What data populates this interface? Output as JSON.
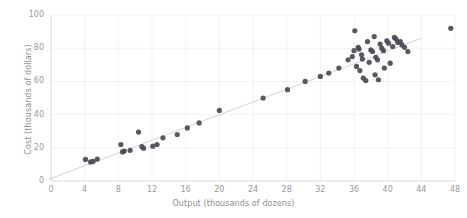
{
  "chart_data": {
    "type": "scatter",
    "title": "",
    "xlabel": "Output (thousands of dozens)",
    "ylabel": "Cost (thousands of dollars)",
    "xlim": [
      0,
      48
    ],
    "ylim": [
      0,
      100
    ],
    "xticks": [
      0,
      4,
      8,
      12,
      16,
      20,
      24,
      28,
      32,
      36,
      40,
      44,
      48
    ],
    "yticks": [
      0,
      20,
      40,
      60,
      80,
      100
    ],
    "grid": true,
    "legend": null,
    "marker_color": "#4a4a52",
    "line_color": "#d3d3d6",
    "grid_color": "#f1f1f3",
    "axis_color": "#e2e2e4",
    "tick_label_color": "#9a9a9a",
    "axis_label_color": "#8d8d8d",
    "series": [
      {
        "name": "observations",
        "marker": "circle",
        "points": [
          [
            4.1,
            13.0
          ],
          [
            4.7,
            11.5
          ],
          [
            5.0,
            11.8
          ],
          [
            5.5,
            13.2
          ],
          [
            8.3,
            22.0
          ],
          [
            8.5,
            17.5
          ],
          [
            8.7,
            18.0
          ],
          [
            9.4,
            18.5
          ],
          [
            10.4,
            29.5
          ],
          [
            10.8,
            20.7
          ],
          [
            11.0,
            19.8
          ],
          [
            12.1,
            21.0
          ],
          [
            12.6,
            22.0
          ],
          [
            13.3,
            26.0
          ],
          [
            15.0,
            28.0
          ],
          [
            16.2,
            32.0
          ],
          [
            17.6,
            35.0
          ],
          [
            20.0,
            42.5
          ],
          [
            25.2,
            50.0
          ],
          [
            28.1,
            55.0
          ],
          [
            30.2,
            60.0
          ],
          [
            32.0,
            63.0
          ],
          [
            33.0,
            65.0
          ],
          [
            34.2,
            68.0
          ],
          [
            35.3,
            73.0
          ],
          [
            35.8,
            75.0
          ],
          [
            36.0,
            78.5
          ],
          [
            36.1,
            90.5
          ],
          [
            36.3,
            69.0
          ],
          [
            36.5,
            80.5
          ],
          [
            36.6,
            79.5
          ],
          [
            36.7,
            66.5
          ],
          [
            36.9,
            76.0
          ],
          [
            37.0,
            73.5
          ],
          [
            37.1,
            62.0
          ],
          [
            37.4,
            60.5
          ],
          [
            37.6,
            84.0
          ],
          [
            37.8,
            71.5
          ],
          [
            38.0,
            79.0
          ],
          [
            38.2,
            78.0
          ],
          [
            38.4,
            87.0
          ],
          [
            38.5,
            64.0
          ],
          [
            38.6,
            74.5
          ],
          [
            38.8,
            73.0
          ],
          [
            38.9,
            61.0
          ],
          [
            39.1,
            82.5
          ],
          [
            39.3,
            80.0
          ],
          [
            39.5,
            78.5
          ],
          [
            39.6,
            68.0
          ],
          [
            39.9,
            84.5
          ],
          [
            40.1,
            83.0
          ],
          [
            40.3,
            71.0
          ],
          [
            40.6,
            81.0
          ],
          [
            40.8,
            86.5
          ],
          [
            41.0,
            85.5
          ],
          [
            41.2,
            83.5
          ],
          [
            41.5,
            84.0
          ],
          [
            41.7,
            82.0
          ],
          [
            42.0,
            80.5
          ],
          [
            42.4,
            78.0
          ],
          [
            47.5,
            92.0
          ]
        ]
      }
    ],
    "trendline": {
      "name": "fitted regression line",
      "x": [
        0,
        44
      ],
      "y": [
        1.5,
        86.0
      ]
    }
  }
}
